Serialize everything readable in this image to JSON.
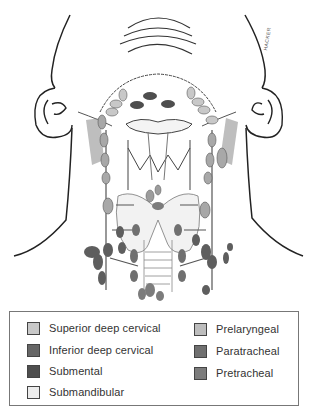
{
  "figure": {
    "signature": "HACKER"
  },
  "colors": {
    "superior_deep_cervical": "#c8c8c8",
    "inferior_deep_cervical": "#666666",
    "submental": "#4e4e4e",
    "submandibular": "#ececec",
    "prelaryngeal": "#bdbdbd",
    "paratracheal": "#707070",
    "pretracheal": "#7c7c7c",
    "line": "#222222"
  },
  "legend": {
    "left_column": [
      {
        "label": "Superior deep cervical",
        "color": "#c8c8c8"
      },
      {
        "label": "Inferior deep cervical",
        "color": "#666666"
      },
      {
        "label": "Submental",
        "color": "#4e4e4e"
      },
      {
        "label": "Submandibular",
        "color": "#ececec"
      }
    ],
    "right_column": [
      {
        "label": "Prelaryngeal",
        "color": "#bdbdbd"
      },
      {
        "label": "Paratracheal",
        "color": "#707070"
      },
      {
        "label": "Pretracheal",
        "color": "#7c7c7c"
      }
    ]
  }
}
